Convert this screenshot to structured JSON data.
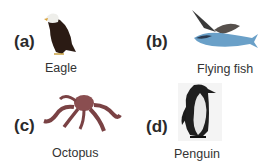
{
  "items": [
    {
      "letter": "(a)",
      "name": "Eagle"
    },
    {
      "letter": "(b)",
      "name": "Flying fish"
    },
    {
      "letter": "(c)",
      "name": "Octopus"
    },
    {
      "letter": "(d)",
      "name": "Penguin"
    }
  ]
}
